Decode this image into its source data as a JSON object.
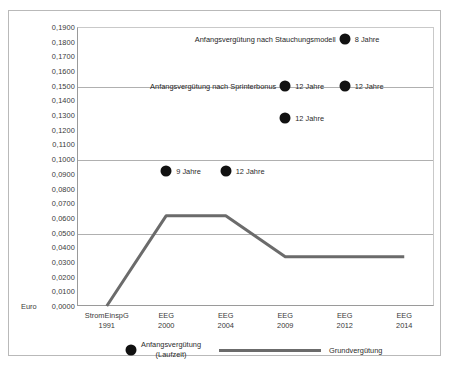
{
  "chart_data": {
    "type": "line",
    "title": "",
    "xlabel": "",
    "ylabel": "Euro",
    "ylim": [
      0.0,
      0.19
    ],
    "ytick_step": 0.01,
    "grid": true,
    "gridline_values": [
      0.05,
      0.1,
      0.15
    ],
    "legend_position": "bottom",
    "categories": [
      "StromEinspG 1991",
      "EEG 2000",
      "EEG 2004",
      "EEG 2009",
      "EEG 2012",
      "EEG 2014"
    ],
    "category_lines": [
      [
        "StromEinspG",
        "1991"
      ],
      [
        "EEG",
        "2000"
      ],
      [
        "EEG",
        "2004"
      ],
      [
        "EEG",
        "2009"
      ],
      [
        "EEG",
        "2012"
      ],
      [
        "EEG",
        "2014"
      ]
    ],
    "ytick_labels": [
      "0,1900",
      "0,1800",
      "0,1700",
      "0,1600",
      "0,1500",
      "0,1400",
      "0,1300",
      "0,1200",
      "0,1100",
      "0,1000",
      "0,0900",
      "0,0800",
      "0,0700",
      "0,0600",
      "0,0500",
      "0,0400",
      "0,0300",
      "0,0200",
      "0,0100",
      "0,0000"
    ],
    "ytick_values": [
      0.19,
      0.18,
      0.17,
      0.16,
      0.15,
      0.14,
      0.13,
      0.12,
      0.11,
      0.1,
      0.09,
      0.08,
      0.07,
      0.06,
      0.05,
      0.04,
      0.03,
      0.02,
      0.01,
      0.0
    ],
    "series": [
      {
        "name": "Grundvergütung",
        "type": "line",
        "color": "#6b6b6b",
        "x": [
          "StromEinspG 1991",
          "EEG 2000",
          "EEG 2004",
          "EEG 2009",
          "EEG 2012",
          "EEG 2014"
        ],
        "values": [
          0.0,
          0.0615,
          0.0615,
          0.0335,
          0.0335,
          0.0335
        ]
      },
      {
        "name": "Anfangsvergütung (Laufzeit)",
        "type": "scatter",
        "color": "#111111",
        "points": [
          {
            "x": "EEG 2000",
            "y": 0.092,
            "label": "9 Jahre"
          },
          {
            "x": "EEG 2004",
            "y": 0.092,
            "label": "12 Jahre"
          },
          {
            "x": "EEG 2009",
            "y": 0.15,
            "label": "12 Jahre"
          },
          {
            "x": "EEG 2009",
            "y": 0.128,
            "label": "12 Jahre"
          },
          {
            "x": "EEG 2012",
            "y": 0.15,
            "label": "12 Jahre"
          },
          {
            "x": "EEG 2012",
            "y": 0.182,
            "label": "8 Jahre"
          }
        ]
      }
    ],
    "annotations": [
      {
        "text": "Anfangsvergütung nach Stauchungsmodell",
        "y": 0.182,
        "anchor_x": "EEG 2012"
      },
      {
        "text": "Anfangsvergütung nach Sprinterbonus",
        "y": 0.15,
        "anchor_x": "EEG 2009"
      }
    ]
  },
  "legend": {
    "marker_label_line1": "Anfangsvergütung",
    "marker_label_line2": "(Laufzeit)",
    "line_label": "Grundvergütung"
  },
  "axis": {
    "y_unit": "Euro"
  }
}
